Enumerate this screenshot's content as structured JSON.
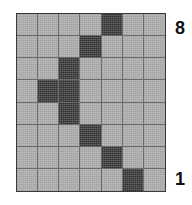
{
  "figure": {
    "type": "lattice-grid-diagram"
  },
  "grid": {
    "columns": 7,
    "rows": 8,
    "light_cell_color": "#b4b4b4",
    "dark_cell_color": "#4a4a4a",
    "gridline_color": "#6d6d6d",
    "border_color": "#3a3a3a",
    "shaded_cells": [
      {
        "row": 1,
        "columns": [
          5
        ]
      },
      {
        "row": 2,
        "columns": [
          4
        ]
      },
      {
        "row": 3,
        "columns": [
          3
        ]
      },
      {
        "row": 4,
        "columns": [
          2,
          3
        ]
      },
      {
        "row": 5,
        "columns": [
          3
        ]
      },
      {
        "row": 6,
        "columns": [
          4
        ]
      },
      {
        "row": 7,
        "columns": [
          5
        ]
      },
      {
        "row": 8,
        "columns": [
          6
        ]
      }
    ]
  },
  "labels": {
    "top_right": "8",
    "bottom_right": "1"
  },
  "chart_data": {
    "type": "heatmap",
    "title": "",
    "xlabel": "",
    "ylabel": "",
    "columns": 7,
    "rows": 8,
    "row_tick_labels": {
      "top": "8",
      "bottom": "1"
    },
    "legend": [],
    "grid": true,
    "values": [
      [
        0,
        0,
        0,
        0,
        1,
        0,
        0
      ],
      [
        0,
        0,
        0,
        1,
        0,
        0,
        0
      ],
      [
        0,
        0,
        1,
        0,
        0,
        0,
        0
      ],
      [
        0,
        1,
        1,
        0,
        0,
        0,
        0
      ],
      [
        0,
        0,
        1,
        0,
        0,
        0,
        0
      ],
      [
        0,
        0,
        0,
        1,
        0,
        0,
        0
      ],
      [
        0,
        0,
        0,
        0,
        1,
        0,
        0
      ],
      [
        0,
        0,
        0,
        0,
        0,
        1,
        0
      ]
    ]
  }
}
